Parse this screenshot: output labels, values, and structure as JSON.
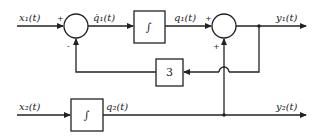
{
  "diagram": {
    "type": "block-diagram",
    "inputs": [
      {
        "id": "x1",
        "label": "x₁(t)"
      },
      {
        "id": "x2",
        "label": "x₂(t)"
      }
    ],
    "outputs": [
      {
        "id": "y1",
        "label": "y₁(t)"
      },
      {
        "id": "y2",
        "label": "y₂(t)"
      }
    ],
    "signals": {
      "q1_dot": "q̇₁(t)",
      "q1": "q₁(t)",
      "q2": "q₂(t)"
    },
    "blocks": {
      "integrator1": {
        "symbol": "∫"
      },
      "integrator2": {
        "symbol": "∫"
      },
      "gain": {
        "value": "3"
      }
    },
    "summers": {
      "sum1": {
        "top_sign": "+",
        "bottom_sign": "-"
      },
      "sum2": {
        "top_sign": "+",
        "bottom_sign": "+"
      }
    },
    "colors": {
      "line": "#222222",
      "background": "#ffffff"
    }
  }
}
